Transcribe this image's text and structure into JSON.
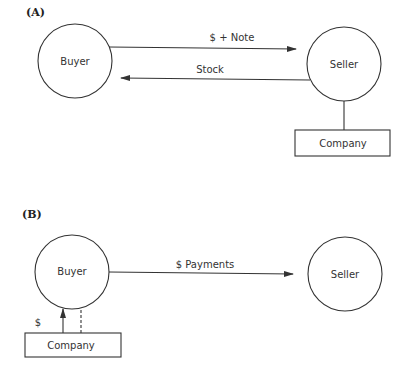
{
  "panels": {
    "A": {
      "label": "(A)",
      "buyer": "Buyer",
      "seller": "Seller",
      "company": "Company",
      "arrow_to_seller": "$ + Note",
      "arrow_to_buyer": "Stock"
    },
    "B": {
      "label": "(B)",
      "buyer": "Buyer",
      "seller": "Seller",
      "company": "Company",
      "arrow_to_seller": "$ Payments",
      "company_to_buyer": "$"
    }
  },
  "colors": {
    "line": "#333333",
    "text": "#333333",
    "background": "#ffffff"
  }
}
